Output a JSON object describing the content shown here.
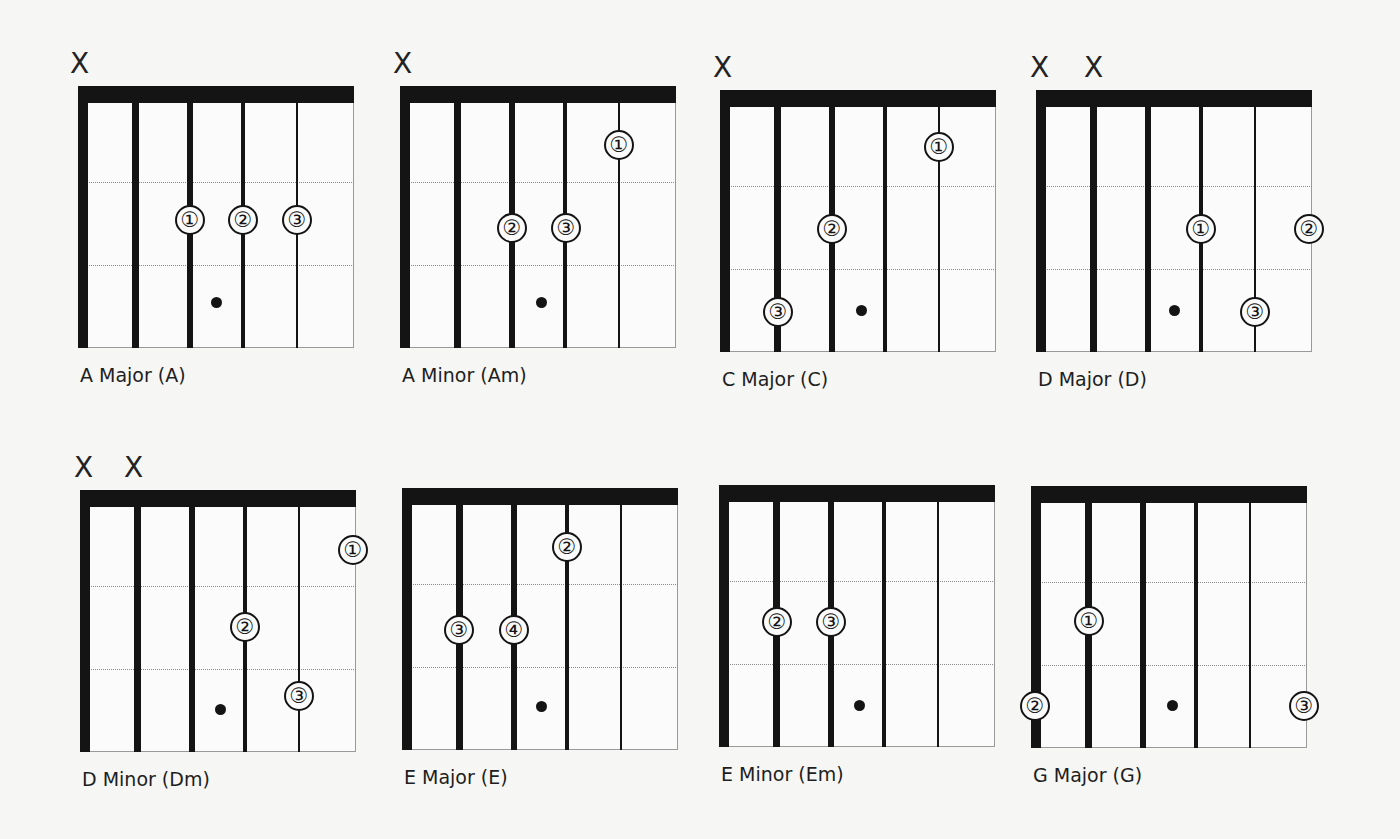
{
  "diagram": {
    "type": "guitar-chord-chart",
    "colors": {
      "background": "#f6f6f5",
      "ink": "#141414",
      "fret_line": "#8a8a8a"
    },
    "mute_symbol": "X",
    "chords": [
      {
        "label": "A Major (A)",
        "muted": [
          "X"
        ],
        "muted_strings": [
          1
        ],
        "fingers": [
          {
            "n": "①",
            "string": 3,
            "fret": 2
          },
          {
            "n": "②",
            "string": 4,
            "fret": 2
          },
          {
            "n": "③",
            "string": 5,
            "fret": 2
          }
        ]
      },
      {
        "label": "A Minor (Am)",
        "muted": [
          "X"
        ],
        "muted_strings": [
          1
        ],
        "fingers": [
          {
            "n": "①",
            "string": 5,
            "fret": 1
          },
          {
            "n": "②",
            "string": 3,
            "fret": 2
          },
          {
            "n": "③",
            "string": 4,
            "fret": 2
          }
        ]
      },
      {
        "label": "C Major (C)",
        "muted": [
          "X"
        ],
        "muted_strings": [
          1
        ],
        "fingers": [
          {
            "n": "①",
            "string": 5,
            "fret": 1
          },
          {
            "n": "②",
            "string": 3,
            "fret": 2
          },
          {
            "n": "③",
            "string": 2,
            "fret": 3
          }
        ]
      },
      {
        "label": "D Major (D)",
        "muted": [
          "X",
          "X"
        ],
        "muted_strings": [
          1,
          2
        ],
        "fingers": [
          {
            "n": "①",
            "string": 4,
            "fret": 2
          },
          {
            "n": "②",
            "string": 6,
            "fret": 2
          },
          {
            "n": "③",
            "string": 5,
            "fret": 3
          }
        ]
      },
      {
        "label": "D Minor (Dm)",
        "muted": [
          "X",
          "X"
        ],
        "muted_strings": [
          1,
          2
        ],
        "fingers": [
          {
            "n": "①",
            "string": 6,
            "fret": 1
          },
          {
            "n": "②",
            "string": 4,
            "fret": 2
          },
          {
            "n": "③",
            "string": 5,
            "fret": 3
          }
        ]
      },
      {
        "label": "E Major (E)",
        "muted": [],
        "muted_strings": [],
        "fingers": [
          {
            "n": "②",
            "string": 4,
            "fret": 1
          },
          {
            "n": "③",
            "string": 2,
            "fret": 2
          },
          {
            "n": "④",
            "string": 3,
            "fret": 2
          }
        ]
      },
      {
        "label": "E Minor (Em)",
        "muted": [],
        "muted_strings": [],
        "fingers": [
          {
            "n": "②",
            "string": 2,
            "fret": 2
          },
          {
            "n": "③",
            "string": 3,
            "fret": 2
          }
        ]
      },
      {
        "label": "G Major (G)",
        "muted": [],
        "muted_strings": [],
        "fingers": [
          {
            "n": "①",
            "string": 2,
            "fret": 2
          },
          {
            "n": "②",
            "string": 1,
            "fret": 3
          },
          {
            "n": "③",
            "string": 6,
            "fret": 3
          }
        ]
      }
    ]
  }
}
